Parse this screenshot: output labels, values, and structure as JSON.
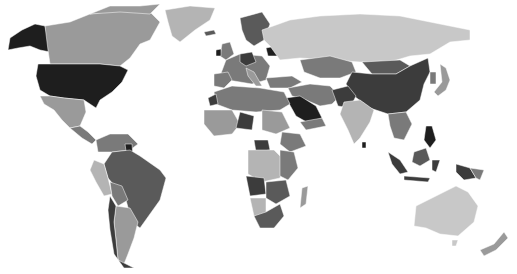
{
  "map": {
    "type": "choropleth",
    "projection": "world",
    "color_scale": "grayscale",
    "legend": null,
    "title": null,
    "palette": {
      "darkest": "#1e1e1e",
      "dark": "#3c3c3c",
      "mid_dark": "#5a5a5a",
      "mid": "#7a7a7a",
      "mid_light": "#9a9a9a",
      "light": "#b4b4b4",
      "lightest": "#c8c8c8",
      "background": "#ffffff"
    },
    "regions": [
      {
        "name": "Alaska",
        "shade": "darkest"
      },
      {
        "name": "Canada",
        "shade": "mid_light"
      },
      {
        "name": "Greenland",
        "shade": "light"
      },
      {
        "name": "United States",
        "shade": "darkest"
      },
      {
        "name": "Mexico",
        "shade": "mid_light"
      },
      {
        "name": "Central America",
        "shade": "mid"
      },
      {
        "name": "Colombia/Venezuela",
        "shade": "mid"
      },
      {
        "name": "Brazil",
        "shade": "mid_dark"
      },
      {
        "name": "Peru",
        "shade": "light"
      },
      {
        "name": "Bolivia",
        "shade": "mid"
      },
      {
        "name": "Argentina",
        "shade": "mid_light"
      },
      {
        "name": "Chile",
        "shade": "dark"
      },
      {
        "name": "Western Europe",
        "shade": "mid"
      },
      {
        "name": "Scandinavia",
        "shade": "mid_dark"
      },
      {
        "name": "Russia",
        "shade": "lightest"
      },
      {
        "name": "Kazakhstan",
        "shade": "mid"
      },
      {
        "name": "China",
        "shade": "dark"
      },
      {
        "name": "Mongolia",
        "shade": "mid_dark"
      },
      {
        "name": "India",
        "shade": "light"
      },
      {
        "name": "Middle East",
        "shade": "mid"
      },
      {
        "name": "Saudi Arabia",
        "shade": "darkest"
      },
      {
        "name": "North Africa",
        "shade": "mid"
      },
      {
        "name": "West Africa",
        "shade": "mid_light"
      },
      {
        "name": "Central Africa",
        "shade": "light"
      },
      {
        "name": "East Africa",
        "shade": "mid"
      },
      {
        "name": "Angola",
        "shade": "dark"
      },
      {
        "name": "Southern Africa",
        "shade": "mid_dark"
      },
      {
        "name": "Madagascar",
        "shade": "mid_light"
      },
      {
        "name": "Southeast Asia",
        "shade": "mid"
      },
      {
        "name": "Indonesia",
        "shade": "dark"
      },
      {
        "name": "Philippines",
        "shade": "darkest"
      },
      {
        "name": "Japan",
        "shade": "mid_light"
      },
      {
        "name": "Australia",
        "shade": "lightest"
      },
      {
        "name": "New Zealand",
        "shade": "mid_light"
      }
    ]
  }
}
